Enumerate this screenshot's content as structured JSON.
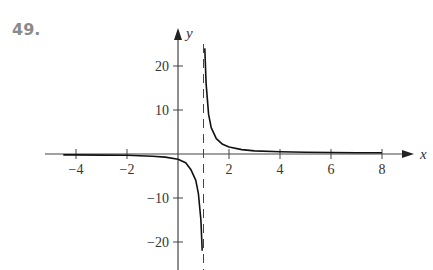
{
  "problem_number": "49.",
  "chart_data": {
    "type": "line",
    "title": "",
    "xlabel": "x",
    "ylabel": "y",
    "xlim": [
      -4.6,
      8.8
    ],
    "ylim": [
      -25,
      25
    ],
    "x_ticks": [
      -4,
      -2,
      2,
      4,
      6,
      8
    ],
    "x_tick_labels": [
      "−4",
      "−2",
      "2",
      "4",
      "6",
      "8"
    ],
    "y_ticks": [
      20,
      10,
      -10,
      -20
    ],
    "y_tick_labels": [
      "20",
      "10",
      "−10",
      "−20"
    ],
    "grid": false,
    "legend": null,
    "vertical_asymptote": {
      "x": 1,
      "style": "dashed"
    },
    "series": [
      {
        "name": "left branch",
        "x": [
          -4.5,
          -4,
          -3,
          -2,
          -1,
          -0.5,
          0,
          0.3,
          0.5,
          0.7,
          0.8,
          0.9,
          0.95
        ],
        "y": [
          -0.2,
          -0.2,
          -0.25,
          -0.3,
          -0.5,
          -0.7,
          -1.2,
          -2,
          -3.5,
          -6,
          -9,
          -15,
          -22
        ]
      },
      {
        "name": "right branch",
        "x": [
          1.05,
          1.1,
          1.2,
          1.3,
          1.5,
          1.75,
          2,
          2.5,
          3,
          4,
          5,
          6,
          7,
          8
        ],
        "y": [
          24,
          16,
          9,
          6,
          3.5,
          2.2,
          1.6,
          1,
          0.7,
          0.5,
          0.4,
          0.35,
          0.3,
          0.3
        ]
      }
    ]
  }
}
